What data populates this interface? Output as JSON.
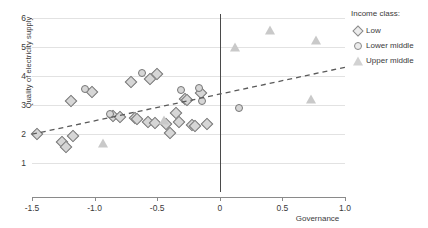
{
  "chart_data": {
    "type": "scatter",
    "title": "",
    "xlabel": "Governance",
    "ylabel": "Quality of electricity supply",
    "xlim": [
      -1.5,
      1.0
    ],
    "ylim": [
      0.6,
      6.15
    ],
    "xticks": [
      "-1.5",
      "-1.0",
      "-0.5",
      "0",
      "0.5",
      "1.0"
    ],
    "xtick_values": [
      -1.5,
      -1.0,
      -0.5,
      0,
      0.5,
      1.0
    ],
    "yticks": [
      "1",
      "2",
      "3",
      "4",
      "5",
      "6"
    ],
    "ytick_values": [
      1,
      2,
      3,
      4,
      5,
      6
    ],
    "grid": "horizontal",
    "legend_position": "right",
    "legend_title": "Income class:",
    "series": [
      {
        "name": "Low",
        "marker": "diamond",
        "points": [
          [
            -1.46,
            2.0
          ],
          [
            -1.26,
            1.72
          ],
          [
            -1.23,
            1.55
          ],
          [
            -1.17,
            1.92
          ],
          [
            -1.19,
            3.12
          ],
          [
            -1.02,
            3.45
          ],
          [
            -0.85,
            2.62
          ],
          [
            -0.8,
            2.58
          ],
          [
            -0.71,
            3.8
          ],
          [
            -0.68,
            2.55
          ],
          [
            -0.66,
            2.52
          ],
          [
            -0.56,
            3.88
          ],
          [
            -0.5,
            4.08
          ],
          [
            -0.57,
            2.4
          ],
          [
            -0.52,
            2.38
          ],
          [
            -0.43,
            2.35
          ],
          [
            -0.4,
            2.02
          ],
          [
            -0.35,
            2.72
          ],
          [
            -0.33,
            2.42
          ],
          [
            -0.28,
            3.22
          ],
          [
            -0.26,
            3.18
          ],
          [
            -0.22,
            2.3
          ],
          [
            -0.2,
            2.28
          ],
          [
            -0.15,
            3.42
          ],
          [
            -0.1,
            2.35
          ]
        ]
      },
      {
        "name": "Lower middle",
        "marker": "circle",
        "points": [
          [
            -1.08,
            3.55
          ],
          [
            -0.88,
            2.7
          ],
          [
            -0.62,
            4.12
          ],
          [
            -0.31,
            3.52
          ],
          [
            -0.17,
            3.58
          ],
          [
            -0.14,
            3.15
          ],
          [
            0.15,
            2.9
          ]
        ]
      },
      {
        "name": "Upper middle",
        "marker": "triangle",
        "points": [
          [
            -0.93,
            1.68
          ],
          [
            -0.45,
            2.48
          ],
          [
            0.12,
            5.0
          ],
          [
            0.4,
            5.58
          ],
          [
            0.73,
            3.2
          ],
          [
            0.77,
            5.25
          ]
        ]
      }
    ],
    "trendline": {
      "style": "dashed",
      "color": "#5a5a5a",
      "x0": -1.5,
      "y0": 1.98,
      "x1": 1.0,
      "y1": 4.3
    }
  },
  "legend": {
    "title": "Income class:",
    "entries": [
      {
        "label": "Low",
        "marker": "diamond"
      },
      {
        "label": "Lower middle",
        "marker": "circle"
      },
      {
        "label": "Upper middle",
        "marker": "triangle"
      }
    ]
  },
  "axes": {
    "x_title": "Governance",
    "y_title": "Quality of electricity supply"
  }
}
